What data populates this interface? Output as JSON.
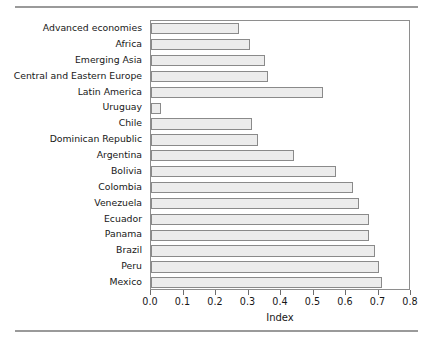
{
  "chart_data": {
    "type": "bar",
    "orientation": "horizontal",
    "title": "",
    "xlabel": "Index",
    "ylabel": "",
    "xlim": [
      0.0,
      0.8
    ],
    "xticks": [
      "0.0",
      "0.1",
      "0.2",
      "0.3",
      "0.4",
      "0.5",
      "0.6",
      "0.7",
      "0.8"
    ],
    "xtick_values": [
      0.0,
      0.1,
      0.2,
      0.3,
      0.4,
      0.5,
      0.6,
      0.7,
      0.8
    ],
    "grid": false,
    "legend": null,
    "bar_face_color": "#ececec",
    "bar_edge_color": "#8a8a8a",
    "categories": [
      "Advanced economies",
      "Africa",
      "Emerging Asia",
      "Central and Eastern Europe",
      "Latin America",
      "Uruguay",
      "Chile",
      "Dominican Republic",
      "Argentina",
      "Bolivia",
      "Colombia",
      "Venezuela",
      "Ecuador",
      "Panama",
      "Brazil",
      "Peru",
      "Mexico"
    ],
    "values": [
      0.27,
      0.305,
      0.35,
      0.36,
      0.53,
      0.03,
      0.31,
      0.33,
      0.44,
      0.57,
      0.62,
      0.64,
      0.67,
      0.67,
      0.69,
      0.7,
      0.71
    ]
  }
}
